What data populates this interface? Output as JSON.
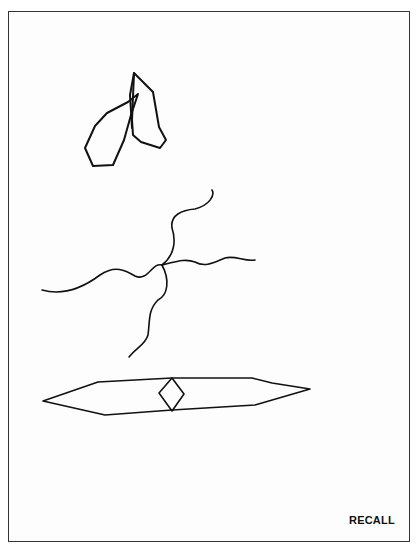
{
  "page": {
    "label": "RECALL",
    "colors": {
      "stroke": "#111111",
      "border": "#333333",
      "background": "#ffffff"
    }
  },
  "figures": [
    {
      "name": "overlapping-pentagons",
      "description": "two overlapping hand-drawn polygons"
    },
    {
      "name": "wavy-cross",
      "description": "four wavy lines crossing at a center point"
    },
    {
      "name": "elongated-hexagon-with-diamond",
      "description": "long flat hexagon with small diamond in center"
    }
  ]
}
